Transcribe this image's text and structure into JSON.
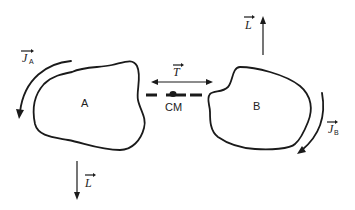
{
  "diagram": {
    "bodies": [
      {
        "id": "A",
        "label": "A"
      },
      {
        "id": "B",
        "label": "B"
      }
    ],
    "center_of_mass": {
      "label": "CM"
    },
    "vectors": {
      "J_A": {
        "symbol": "J",
        "subscript": "A",
        "description": "spin angular momentum of A (arc arrow, counterclockwise)"
      },
      "J_B": {
        "symbol": "J",
        "subscript": "B",
        "description": "spin angular momentum of B (arc arrow, clockwise)"
      },
      "T": {
        "symbol": "T",
        "description": "double-headed arrow between bodies"
      },
      "L_up": {
        "symbol": "L",
        "description": "orbital angular momentum arrow pointing up, near B"
      },
      "L_down": {
        "symbol": "L",
        "description": "orbital angular momentum arrow pointing down, below A"
      }
    },
    "colors": {
      "ink": "#1a1a1a",
      "background": "#ffffff"
    }
  }
}
